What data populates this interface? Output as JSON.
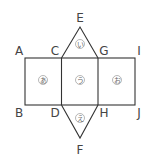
{
  "diagram": {
    "vertices": {
      "A": "A",
      "B": "B",
      "C": "C",
      "D": "D",
      "E": "E",
      "F": "F",
      "G": "G",
      "H": "H",
      "I": "I",
      "J": "J"
    },
    "faces": {
      "left_square": "あ",
      "top_triangle": "い",
      "middle_square": "う",
      "bottom_triangle": "え",
      "right_square": "お"
    },
    "colors": {
      "line": "#333333",
      "label": "#444444"
    }
  }
}
